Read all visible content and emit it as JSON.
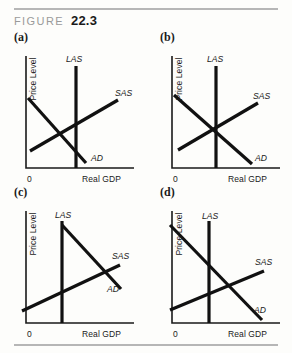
{
  "figure": {
    "label": "FIGURE",
    "number": "22.3"
  },
  "axes": {
    "y_label": "Price Level",
    "x_label": "Real GDP",
    "origin": "0"
  },
  "curve_labels": {
    "las": "LAS",
    "sas": "SAS",
    "ad": "AD"
  },
  "panels": [
    {
      "letter": "(a)",
      "description": "AD intersects SAS to the left of LAS (below potential GDP)",
      "las_x": 68,
      "sas": {
        "x1": 22,
        "y1": 103,
        "x2": 110,
        "y2": 52
      },
      "ad": {
        "x1": 20,
        "y1": 50,
        "x2": 78,
        "y2": 115
      },
      "label_pos": {
        "las": {
          "x": 58,
          "y": 14
        },
        "sas": {
          "x": 107,
          "y": 48
        },
        "ad": {
          "x": 83,
          "y": 113
        }
      }
    },
    {
      "letter": "(b)",
      "description": "AD, SAS and LAS all intersect at the same point (long-run equilibrium)",
      "las_x": 62,
      "sas": {
        "x1": 24,
        "y1": 102,
        "x2": 104,
        "y2": 55
      },
      "ad": {
        "x1": 20,
        "y1": 47,
        "x2": 98,
        "y2": 116
      },
      "label_pos": {
        "las": {
          "x": 53,
          "y": 14
        },
        "sas": {
          "x": 99,
          "y": 51
        },
        "ad": {
          "x": 101,
          "y": 113
        }
      }
    },
    {
      "letter": "(c)",
      "description": "AD starts at top of LAS; AD intersects SAS to the right of LAS",
      "las_x": 54,
      "sas": {
        "x1": 14,
        "y1": 108,
        "x2": 112,
        "y2": 62
      },
      "ad": {
        "x1": 54,
        "y1": 22,
        "x2": 113,
        "y2": 86
      },
      "label_pos": {
        "las": {
          "x": 47,
          "y": 15
        },
        "sas": {
          "x": 104,
          "y": 56
        },
        "ad": {
          "x": 99,
          "y": 89
        }
      }
    },
    {
      "letter": "(d)",
      "description": "AD intersects SAS to the right of LAS (above potential GDP)",
      "las_x": 55,
      "sas": {
        "x1": 16,
        "y1": 107,
        "x2": 110,
        "y2": 68
      },
      "ad": {
        "x1": 16,
        "y1": 22,
        "x2": 108,
        "y2": 117
      },
      "label_pos": {
        "las": {
          "x": 48,
          "y": 16
        },
        "sas": {
          "x": 101,
          "y": 62
        },
        "ad": {
          "x": 100,
          "y": 110
        }
      }
    }
  ]
}
